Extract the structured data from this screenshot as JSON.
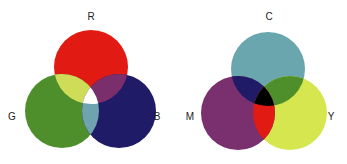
{
  "diagrams": {
    "additive": {
      "title": "RGB additive color model",
      "labels": {
        "r": "R",
        "g": "G",
        "b": "B"
      },
      "colors": {
        "r": "#e21a14",
        "g": "#4e8f2c",
        "b": "#1f1b66",
        "rg": "#cfdc58",
        "rb": "#7a2e6c",
        "gb": "#6fa3b0",
        "rgb": "#ffffff"
      }
    },
    "subtractive": {
      "title": "CMY subtractive color model",
      "labels": {
        "c": "C",
        "m": "M",
        "y": "Y"
      },
      "colors": {
        "c": "#6aa6ad",
        "m": "#7a2f6e",
        "y": "#d5e64f",
        "cm": "#1f1b66",
        "cy": "#4e8f2c",
        "my": "#e21a14",
        "cmy": "#000000"
      }
    }
  }
}
